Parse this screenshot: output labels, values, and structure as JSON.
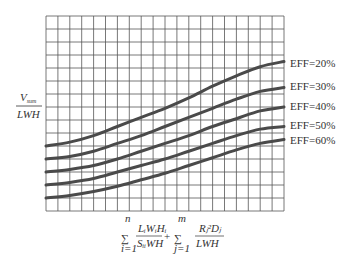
{
  "chart_data": {
    "type": "line",
    "title": "",
    "ylabel": {
      "numerator": "V",
      "numerator_sub": "sum",
      "denominator": "LWH"
    },
    "xlabel": {
      "term1": {
        "sum_lower": "i=1",
        "sum_upper": "n",
        "numerator": "LᵢWᵢHᵢ",
        "denominator": "SᵢᵢWH"
      },
      "operator": "+",
      "term2": {
        "sum_lower": "j=1",
        "sum_upper": "m",
        "numerator": "Rⱼ²Dⱼ",
        "denominator": "LWH"
      }
    },
    "xlim": [
      0,
      20
    ],
    "ylim": [
      0,
      15
    ],
    "grid": true,
    "grid_cols": 20,
    "grid_rows": 15,
    "tick_labels": "none",
    "legend_placement": "right-inline",
    "x": [
      0,
      2,
      4,
      6,
      8,
      10,
      12,
      14,
      16,
      18,
      20
    ],
    "series": [
      {
        "name": "EFF=20%",
        "values": [
          5.0,
          5.3,
          5.8,
          6.5,
          7.2,
          7.9,
          8.7,
          9.6,
          10.4,
          11.1,
          11.5
        ]
      },
      {
        "name": "EFF=30%",
        "values": [
          4.0,
          4.2,
          4.6,
          5.2,
          5.8,
          6.5,
          7.2,
          7.9,
          8.6,
          9.2,
          9.5
        ]
      },
      {
        "name": "EFF=40%",
        "values": [
          3.0,
          3.2,
          3.5,
          4.0,
          4.6,
          5.2,
          5.8,
          6.5,
          7.1,
          7.7,
          8.0
        ]
      },
      {
        "name": "EFF=50%",
        "values": [
          2.0,
          2.2,
          2.5,
          3.0,
          3.5,
          4.0,
          4.6,
          5.2,
          5.8,
          6.3,
          6.5
        ]
      },
      {
        "name": "EFF=60%",
        "values": [
          1.0,
          1.2,
          1.5,
          1.9,
          2.4,
          2.9,
          3.5,
          4.1,
          4.7,
          5.2,
          5.5
        ]
      }
    ],
    "colors": {
      "curve": "#4a4a4a",
      "grid": "#555555",
      "text": "#333333"
    }
  }
}
